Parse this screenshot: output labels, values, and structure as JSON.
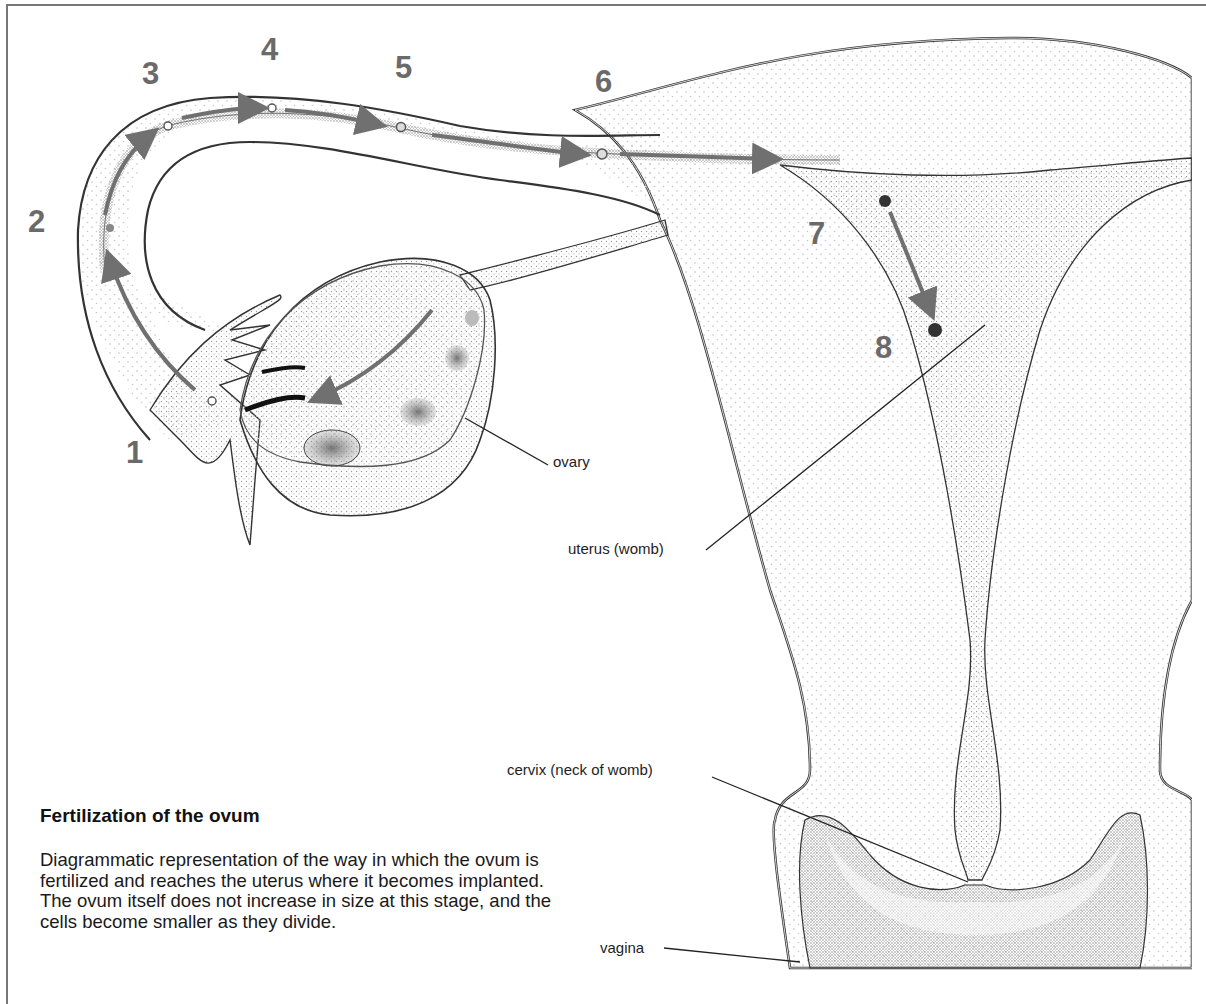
{
  "figure": {
    "title": "Fertilization of the ovum",
    "caption": "Diagrammatic representation of the way in which the ovum is fertilized and reaches the uterus where it becomes implanted. The ovum itself does not increase in size at this stage, and the cells become smaller as they divide."
  },
  "stages": [
    {
      "number": "1",
      "x": 126,
      "y": 437
    },
    {
      "number": "2",
      "x": 28,
      "y": 206
    },
    {
      "number": "3",
      "x": 142,
      "y": 58
    },
    {
      "number": "4",
      "x": 261,
      "y": 34
    },
    {
      "number": "5",
      "x": 395,
      "y": 52
    },
    {
      "number": "6",
      "x": 595,
      "y": 66
    },
    {
      "number": "7",
      "x": 808,
      "y": 218
    },
    {
      "number": "8",
      "x": 875,
      "y": 332
    }
  ],
  "labels": {
    "ovary": "ovary",
    "uterus": "uterus (womb)",
    "cervix": "cervix (neck of womb)",
    "vagina": "vagina"
  },
  "colors": {
    "frame": "#777777",
    "stage_number": "#6a6a6a",
    "arrow": "#707070",
    "outline": "#333333",
    "stipple": "#bdbdbd"
  }
}
